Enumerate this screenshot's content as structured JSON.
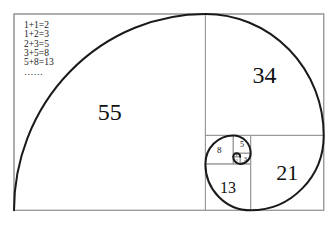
{
  "equations": [
    "1+1=2",
    "1+2=3",
    "2+3=5",
    "3+5=8",
    "5+8=13",
    "……"
  ],
  "squares": [
    {
      "size": 55,
      "label": "55"
    },
    {
      "size": 34,
      "label": "34"
    },
    {
      "size": 21,
      "label": "21"
    },
    {
      "size": 13,
      "label": "13"
    },
    {
      "size": 8,
      "label": "8"
    },
    {
      "size": 5,
      "label": "5"
    },
    {
      "size": 3,
      "label": "3"
    },
    {
      "size": 2,
      "label": "2"
    },
    {
      "size": 1,
      "label": "1"
    },
    {
      "size": 1,
      "label": "1"
    }
  ],
  "colors": {
    "grid": "#9a9a9a",
    "spiral": "#1a1a1a",
    "text": "#111111"
  }
}
